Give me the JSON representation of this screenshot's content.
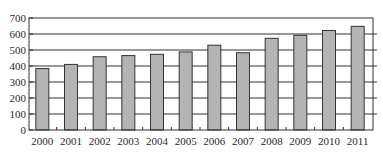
{
  "chart_data": {
    "type": "bar",
    "title": "",
    "xlabel": "",
    "ylabel": "",
    "categories": [
      "2000",
      "2001",
      "2002",
      "2003",
      "2004",
      "2005",
      "2006",
      "2007",
      "2008",
      "2009",
      "2010",
      "2011"
    ],
    "values": [
      384,
      410,
      458,
      465,
      473,
      488,
      530,
      483,
      573,
      592,
      622,
      648
    ],
    "ylim": [
      0,
      700
    ],
    "yticks": [
      0,
      100,
      200,
      300,
      400,
      500,
      600,
      700
    ],
    "grid": true,
    "legend": null,
    "colors": {
      "bar_fill": "#b4b4b4",
      "bar_stroke": "#333333",
      "grid": "#333333",
      "axis": "#333333"
    }
  }
}
